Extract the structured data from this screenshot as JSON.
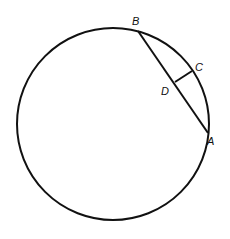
{
  "diagram": {
    "type": "circle-chord",
    "circle": {
      "cx": 113,
      "cy": 124,
      "r": 96
    },
    "points": {
      "A": {
        "label": "A",
        "x": 208,
        "y": 133
      },
      "B": {
        "label": "B",
        "x": 138,
        "y": 31
      },
      "C": {
        "label": "C",
        "x": 192,
        "y": 71
      },
      "D": {
        "label": "D",
        "x": 175,
        "y": 81
      }
    },
    "segments": [
      "AB",
      "CD"
    ],
    "stroke_color": "#111111"
  }
}
